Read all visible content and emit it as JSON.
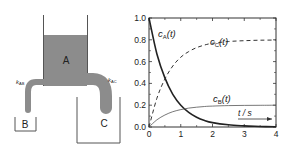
{
  "diagram": {
    "tank_label": "A",
    "beaker_b_label": "B",
    "beaker_c_label": "C",
    "rate_ab": "k",
    "rate_ab_sub": "AB",
    "rate_ac": "k",
    "rate_ac_sub": "AC",
    "liquid_color": "#8c8c8c",
    "line_color": "#444444"
  },
  "chart_data": {
    "type": "line",
    "title": "",
    "xlabel": "t / s",
    "ylabel": "",
    "xlim": [
      0,
      4
    ],
    "ylim": [
      0,
      1.0
    ],
    "x_ticks": [
      "0",
      "1",
      "2",
      "3",
      "4"
    ],
    "y_ticks": [
      "0.0",
      "0.2",
      "0.4",
      "0.6",
      "0.8",
      "1.0"
    ],
    "grid": false,
    "x": [
      0,
      0.25,
      0.5,
      0.75,
      1.0,
      1.25,
      1.5,
      1.75,
      2.0,
      2.5,
      3.0,
      3.5,
      4.0
    ],
    "series": [
      {
        "name": "cA(t)",
        "label_main": "c",
        "label_sub": "A",
        "style": "solid-thick",
        "values": [
          1.0,
          0.67,
          0.45,
          0.3,
          0.2,
          0.135,
          0.09,
          0.06,
          0.04,
          0.02,
          0.01,
          0.005,
          0.002
        ]
      },
      {
        "name": "cB(t)",
        "label_main": "c",
        "label_sub": "B",
        "style": "solid-thin",
        "values": [
          0.0,
          0.066,
          0.11,
          0.14,
          0.16,
          0.173,
          0.182,
          0.188,
          0.192,
          0.196,
          0.198,
          0.199,
          0.2
        ]
      },
      {
        "name": "cC(t)",
        "label_main": "c",
        "label_sub": "C",
        "style": "dashed",
        "values": [
          0.0,
          0.264,
          0.44,
          0.56,
          0.64,
          0.692,
          0.728,
          0.752,
          0.768,
          0.784,
          0.792,
          0.796,
          0.798
        ]
      }
    ],
    "annotations": [
      "cA(t)",
      "cC(t)",
      "cB(t)",
      "t / s →"
    ]
  }
}
